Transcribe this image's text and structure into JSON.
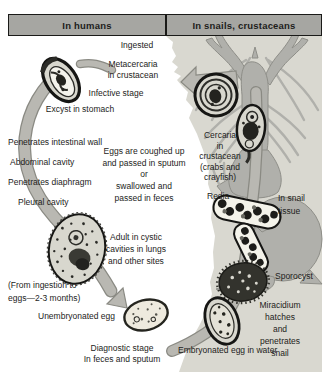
{
  "colors": {
    "paper": "#ffffff",
    "ink": "#1d1d1b",
    "header-fill": "#a6a6a2",
    "panel-bg": "#d9d8d0",
    "silhouette": "#b0b0ab",
    "silhouette-stroke": "#8e8e88",
    "arrow-fill": "#b9b8b2",
    "arrow-stroke": "#8a8a83",
    "organism-fill": "#d8d7ce",
    "organism-dark": "#23231f",
    "capsule-fill": "#f4f3ea",
    "egg-fill": "#eeeade"
  },
  "headers": {
    "left": "In humans",
    "right": "In snails, crustaceans"
  },
  "labels": {
    "ingested": "Ingested",
    "metacercaria": "Metacercaria\nin crustacean",
    "infective_stage": "Infective stage",
    "excyst": "Excyst in stomach",
    "penetrates_wall": "Penetrates intestinal wall",
    "abdominal_cavity": "Abdominal cavity",
    "penetrates_diaphragm": "Penetrates diaphragm",
    "pleural_cavity": "Pleural cavity",
    "eggs_passed": "Eggs are coughed up\nand passed in sputum\nor\nswallowed and\npassed in feces",
    "adult_cystic": "Adult in cystic\ncavities in lungs\nand other sites",
    "duration": "(From ingestion to\neggs—2-3 months)",
    "unembryonated_egg": "Unembryonated egg",
    "diagnostic_stage": "Diagnostic stage\nIn feces and sputum",
    "cercaria": "Cercaria\nin\ncrustacean\n(crabs and\ncrayfish)",
    "redia": "Redia",
    "in_snail_tissue": "In snail\ntissue",
    "sporocyst": "Sporocyst",
    "miracidium": "Miracidium hatches\nand penetrates snail",
    "embryonated_egg": "Embryonated egg in water"
  }
}
